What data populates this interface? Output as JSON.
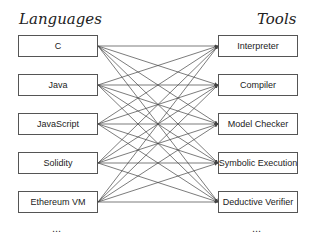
{
  "headings": {
    "left": "Languages",
    "right": "Tools"
  },
  "languages": [
    {
      "label": "C"
    },
    {
      "label": "Java"
    },
    {
      "label": "JavaScript"
    },
    {
      "label": "Solidity"
    },
    {
      "label": "Ethereum VM"
    }
  ],
  "tools": [
    {
      "label": "Interpreter"
    },
    {
      "label": "Compiler"
    },
    {
      "label": "Model Checker"
    },
    {
      "label": "Symbolic Execution"
    },
    {
      "label": "Deductive Verifier"
    }
  ],
  "ellipsis": {
    "left": "...",
    "right": "..."
  },
  "connections": "all-to-all",
  "colors": {
    "line": "#444444",
    "border": "#555555"
  }
}
